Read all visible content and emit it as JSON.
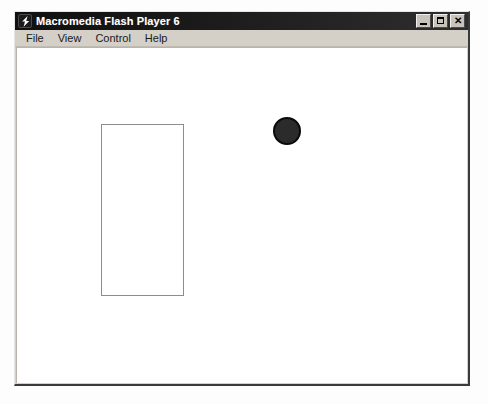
{
  "window": {
    "title": "Macromedia Flash Player 6",
    "icon": "flash-bolt-icon",
    "controls": {
      "minimize_label": "_",
      "maximize_label": "□",
      "close_label": "✕",
      "minimize_name": "minimize-button",
      "maximize_name": "maximize-button",
      "close_name": "close-button"
    }
  },
  "menu": {
    "items": [
      {
        "label": "File"
      },
      {
        "label": "View"
      },
      {
        "label": "Control"
      },
      {
        "label": "Help"
      }
    ]
  },
  "stage": {
    "background_color": "#ffffff",
    "shapes": [
      {
        "name": "rectangle",
        "type": "rect",
        "x": 84,
        "y": 76,
        "width": 83,
        "height": 172,
        "fill": "none",
        "stroke": "#8d8d8d",
        "stroke_width": 1
      },
      {
        "name": "ball",
        "type": "circle",
        "x": 256,
        "y": 69,
        "diameter": 28,
        "fill": "#2b2b2b",
        "stroke": "#0a0a0a",
        "stroke_width": 2
      }
    ]
  },
  "colors": {
    "title_bar": "#1a1a1a",
    "title_text": "#ffffff",
    "chrome": "#d4d0c8",
    "stage": "#ffffff",
    "desktop": "#fdfdfd"
  }
}
